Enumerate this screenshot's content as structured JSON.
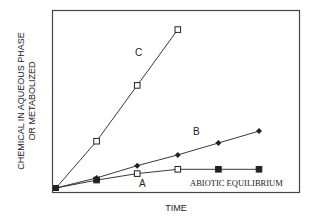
{
  "chart_data": {
    "type": "line",
    "title": "",
    "xlabel": "TIME",
    "ylabel": [
      "CHEMICAL IN AQUEOUS PHASE",
      "OR METABOLIZED"
    ],
    "x": [
      0,
      1,
      2,
      3,
      4,
      5
    ],
    "xlim": [
      0,
      5.3
    ],
    "ylim": [
      0,
      4.6
    ],
    "grid": false,
    "legend": "inline labels",
    "series": [
      {
        "name": "C",
        "marker": "open-square",
        "x": [
          0,
          1,
          2,
          3
        ],
        "values": [
          0,
          1.3,
          2.85,
          4.4
        ]
      },
      {
        "name": "B",
        "marker": "filled-diamond",
        "x": [
          0,
          1,
          2,
          3,
          4,
          5
        ],
        "values": [
          0,
          0.28,
          0.62,
          0.92,
          1.25,
          1.58
        ]
      },
      {
        "name": "A",
        "marker": "square",
        "x": [
          0,
          1,
          2,
          3,
          4,
          5
        ],
        "values": [
          0,
          0.22,
          0.4,
          0.52,
          0.52,
          0.52
        ]
      }
    ],
    "annotations": [
      {
        "text": "C",
        "near_series": "C"
      },
      {
        "text": "B",
        "near_series": "B"
      },
      {
        "text": "A",
        "near_series": "A"
      },
      {
        "text": "ABIOTIC EQUILIBRIUM",
        "near_series": "A"
      }
    ]
  },
  "labels": {
    "c": "C",
    "b": "B",
    "a": "A",
    "abiotic": "ABIOTIC EQUILIBRIUM",
    "xlabel": "TIME",
    "ylabel1": "CHEMICAL IN AQUEOUS PHASE",
    "ylabel2": "OR METABOLIZED"
  }
}
